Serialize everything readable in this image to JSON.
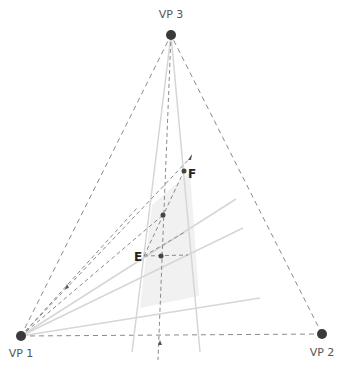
{
  "diagram": {
    "type": "three-point-perspective",
    "colors": {
      "vanishing_point": "#3a3a3a",
      "dashed_line": "#8a8a8a",
      "solid_line": "#d6d6d6",
      "shaded_plane": "#f1f1f1",
      "point": "#444444",
      "label": "#555555",
      "point_label": "#222222"
    },
    "vanishing_points": [
      {
        "id": "vp1",
        "label": "VP 1",
        "x": 21,
        "y": 336
      },
      {
        "id": "vp2",
        "label": "VP 2",
        "x": 322,
        "y": 334
      },
      {
        "id": "vp3",
        "label": "VP 3",
        "x": 171,
        "y": 35
      }
    ],
    "points": [
      {
        "id": "E",
        "label": "E",
        "x": 144,
        "y": 256
      },
      {
        "id": "F",
        "label": "F",
        "x": 184,
        "y": 171
      },
      {
        "id": "P1",
        "label": "",
        "x": 163,
        "y": 215
      },
      {
        "id": "P2",
        "label": "",
        "x": 161,
        "y": 256
      }
    ]
  }
}
